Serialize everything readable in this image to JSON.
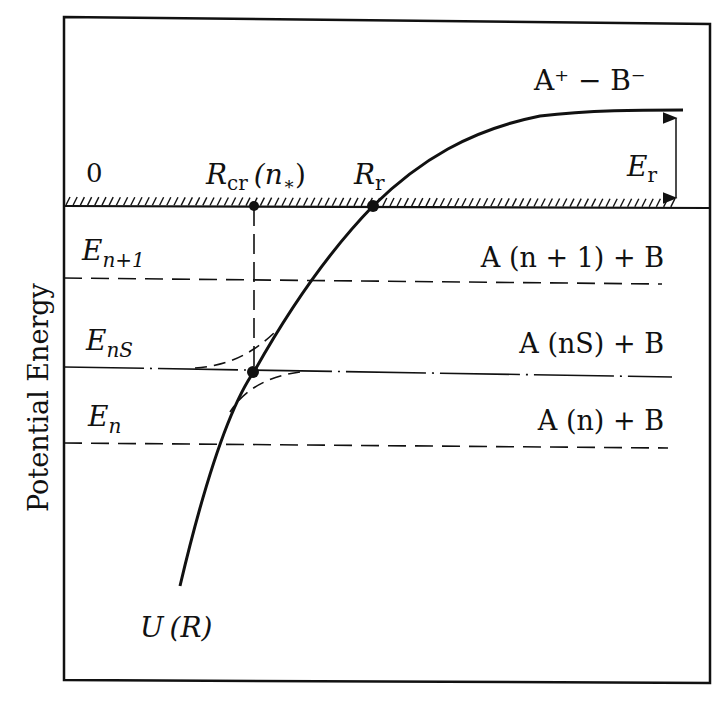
{
  "chart_data": {
    "type": "diagram",
    "title": "",
    "ylabel": "Potential Energy",
    "xlabel": "",
    "zero_label": "0",
    "curve": {
      "name": "U(R)",
      "label_main": "U",
      "label_arg": "(R)",
      "asymptote_label": "A⁺ − B⁻",
      "description": "Ionic (Coulomb) potential rising from bottom-left, crossing zero at R_r, leveling to E_r above zero"
    },
    "points": {
      "R_cr": {
        "label_main": "R",
        "label_sub": "cr",
        "label_arg": "(n",
        "label_star": "∗",
        "label_close": ")"
      },
      "R_r": {
        "label_main": "R",
        "label_sub": "r"
      }
    },
    "gap": {
      "label_main": "E",
      "label_sub": "r"
    },
    "levels": [
      {
        "name": "E_{n+1}",
        "label_main": "E",
        "label_sub": "n+1",
        "channel": "A (n + 1) + B",
        "style": "dashed"
      },
      {
        "name": "E_{nS}",
        "label_main": "E",
        "label_sub": "nS",
        "channel": "A (nS) + B",
        "style": "dash-dot"
      },
      {
        "name": "E_n",
        "label_main": "E",
        "label_sub": "n",
        "channel": "A (n) + B",
        "style": "dashed"
      }
    ],
    "colors": {
      "ink": "#111111",
      "background": "#ffffff"
    }
  }
}
